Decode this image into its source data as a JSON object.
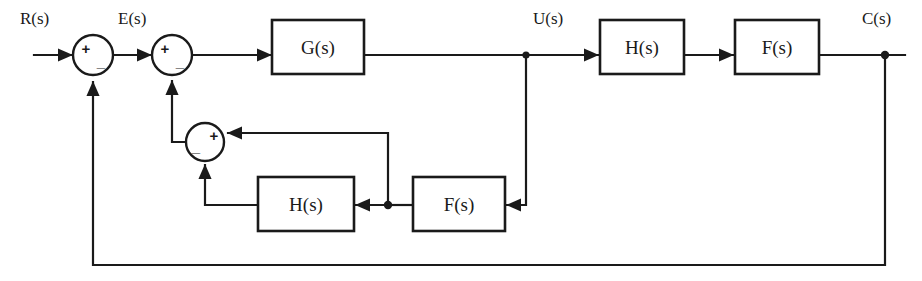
{
  "diagram": {
    "type": "block-diagram",
    "colors": {
      "line": "#1a1a1a",
      "background": "#ffffff",
      "block_fill": "#ffffff"
    },
    "signals": [
      {
        "id": "input",
        "label": "R(s)",
        "x": 20,
        "y": 22
      },
      {
        "id": "error",
        "label": "E(s)",
        "x": 118,
        "y": 22
      },
      {
        "id": "plant_out",
        "label": "U(s)",
        "x": 538,
        "y": 22
      },
      {
        "id": "output",
        "label": "C(s)",
        "x": 862,
        "y": 22
      }
    ],
    "blocks": [
      {
        "id": "g-forward",
        "label": "G(s)",
        "x": 272,
        "y": 20,
        "w": 92,
        "h": 54
      },
      {
        "id": "h-top",
        "label": "H(s)",
        "x": 600,
        "y": 20,
        "w": 84,
        "h": 54
      },
      {
        "id": "f-top",
        "label": "F(s)",
        "x": 735,
        "y": 20,
        "w": 84,
        "h": 54
      },
      {
        "id": "h-bottom",
        "label": "H(s)",
        "x": 258,
        "y": 177,
        "w": 96,
        "h": 54
      },
      {
        "id": "f-bottom",
        "label": "F(s)",
        "x": 413,
        "y": 177,
        "w": 92,
        "h": 54
      }
    ],
    "summing_junctions": [
      {
        "id": "sum-outer",
        "cx": 93,
        "cy": 52,
        "r": 20,
        "signs": [
          {
            "symbol": "+",
            "dx": -7,
            "dy": -2
          },
          {
            "symbol": "_",
            "dx": 8,
            "dy": 7
          }
        ]
      },
      {
        "id": "sum-inner",
        "cx": 172,
        "cy": 52,
        "r": 20,
        "signs": [
          {
            "symbol": "+",
            "dx": -7,
            "dy": -2
          },
          {
            "symbol": "_",
            "dx": 8,
            "dy": 7
          }
        ]
      },
      {
        "id": "sum-minor",
        "cx": 205,
        "cy": 142,
        "r": 19,
        "signs": [
          {
            "symbol": "+",
            "dx": 8,
            "dy": -2
          },
          {
            "symbol": "_",
            "dx": -8,
            "dy": 6
          }
        ]
      }
    ],
    "nodes": [
      {
        "id": "tap-u",
        "cx": 526,
        "cy": 55
      },
      {
        "id": "tap-c",
        "cx": 885,
        "cy": 55
      },
      {
        "id": "tap-bottom",
        "cx": 388,
        "cy": 205
      }
    ]
  }
}
